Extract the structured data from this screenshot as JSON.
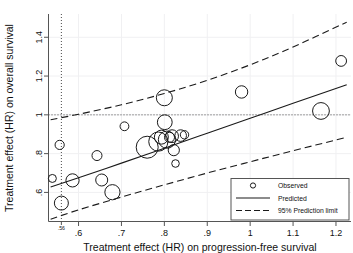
{
  "chart_data": {
    "type": "scatter",
    "title": "",
    "xlabel": "Treatment effect (HR) on progression-free survival",
    "ylabel": "Treatment effect (HR) on overall survival",
    "xlim": [
      0.53,
      1.235
    ],
    "ylim": [
      0.45,
      1.52
    ],
    "xticks": [
      0.6,
      0.7,
      0.8,
      0.9,
      1.0,
      1.1,
      1.2
    ],
    "xtick_labels": [
      ".6",
      ".7",
      ".8",
      ".9",
      "1",
      "1.1",
      "1.2"
    ],
    "yticks": [
      0.6,
      0.8,
      1.0,
      1.2,
      1.4
    ],
    "ytick_labels": [
      ".6",
      ".8",
      "1",
      "1.2",
      "1.4"
    ],
    "special_xtick": {
      "value": 0.56,
      "label": ".56"
    },
    "grid": false,
    "reference_lines": [
      {
        "name": "null-effect-horizontal",
        "orientation": "horizontal",
        "value": 1.0,
        "style": "dotted"
      },
      {
        "name": "threshold-vertical",
        "orientation": "vertical",
        "value": 0.56,
        "style": "dotted"
      }
    ],
    "series": [
      {
        "name": "Observed",
        "marker": "open-circle",
        "points": [
          {
            "x": 0.539,
            "y": 0.672,
            "size": 4.0
          },
          {
            "x": 0.556,
            "y": 0.845,
            "size": 4.6
          },
          {
            "x": 0.56,
            "y": 0.545,
            "size": 7.0
          },
          {
            "x": 0.586,
            "y": 0.662,
            "size": 6.6
          },
          {
            "x": 0.643,
            "y": 0.79,
            "size": 5.0
          },
          {
            "x": 0.654,
            "y": 0.664,
            "size": 6.0
          },
          {
            "x": 0.679,
            "y": 0.601,
            "size": 7.6
          },
          {
            "x": 0.707,
            "y": 0.941,
            "size": 4.4
          },
          {
            "x": 0.76,
            "y": 0.833,
            "size": 11.0
          },
          {
            "x": 0.786,
            "y": 0.862,
            "size": 9.6
          },
          {
            "x": 0.793,
            "y": 0.885,
            "size": 7.0
          },
          {
            "x": 0.8,
            "y": 1.088,
            "size": 8.0
          },
          {
            "x": 0.801,
            "y": 0.962,
            "size": 7.4
          },
          {
            "x": 0.806,
            "y": 0.872,
            "size": 8.6
          },
          {
            "x": 0.812,
            "y": 0.884,
            "size": 5.0
          },
          {
            "x": 0.818,
            "y": 0.89,
            "size": 6.4
          },
          {
            "x": 0.822,
            "y": 0.818,
            "size": 5.6
          },
          {
            "x": 0.826,
            "y": 0.749,
            "size": 3.8
          },
          {
            "x": 0.838,
            "y": 0.893,
            "size": 5.8
          },
          {
            "x": 0.847,
            "y": 0.897,
            "size": 4.2
          },
          {
            "x": 0.98,
            "y": 1.118,
            "size": 6.2
          },
          {
            "x": 1.165,
            "y": 1.02,
            "size": 8.4
          },
          {
            "x": 1.212,
            "y": 1.278,
            "size": 5.4
          }
        ]
      },
      {
        "name": "Predicted",
        "style": "solid",
        "points": [
          {
            "x": 0.535,
            "y": 0.628
          },
          {
            "x": 0.6,
            "y": 0.676
          },
          {
            "x": 0.7,
            "y": 0.751
          },
          {
            "x": 0.8,
            "y": 0.828
          },
          {
            "x": 0.9,
            "y": 0.905
          },
          {
            "x": 1.0,
            "y": 0.982
          },
          {
            "x": 1.1,
            "y": 1.06
          },
          {
            "x": 1.225,
            "y": 1.155
          }
        ]
      },
      {
        "name": "95% Prediction limit (upper)",
        "style": "dashed",
        "points": [
          {
            "x": 0.535,
            "y": 0.975
          },
          {
            "x": 0.6,
            "y": 1.003
          },
          {
            "x": 0.7,
            "y": 1.052
          },
          {
            "x": 0.8,
            "y": 1.11
          },
          {
            "x": 0.9,
            "y": 1.178
          },
          {
            "x": 1.0,
            "y": 1.258
          },
          {
            "x": 1.1,
            "y": 1.35
          },
          {
            "x": 1.225,
            "y": 1.478
          }
        ]
      },
      {
        "name": "95% Prediction limit (lower)",
        "style": "dashed",
        "points": [
          {
            "x": 0.535,
            "y": 0.462
          },
          {
            "x": 0.6,
            "y": 0.51
          },
          {
            "x": 0.7,
            "y": 0.576
          },
          {
            "x": 0.8,
            "y": 0.639
          },
          {
            "x": 0.9,
            "y": 0.7
          },
          {
            "x": 1.0,
            "y": 0.758
          },
          {
            "x": 1.1,
            "y": 0.815
          },
          {
            "x": 1.225,
            "y": 0.884
          }
        ]
      }
    ],
    "legend": {
      "position": "bottom-right",
      "entries": [
        {
          "label": "Observed",
          "marker": "open-circle"
        },
        {
          "label": "Predicted",
          "marker": "solid-line"
        },
        {
          "label": "95% Prediction limit",
          "marker": "dashed-line"
        }
      ]
    },
    "colors": {
      "axis": "#3f3f3f",
      "marker": "#1a1a1a",
      "line": "#1a1a1a",
      "reference": "#4a4a4a",
      "background": "#ffffff"
    }
  }
}
